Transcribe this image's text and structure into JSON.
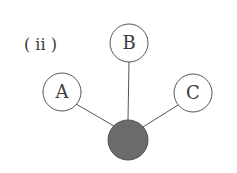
{
  "caption": "( ii )",
  "nodes": [
    {
      "id": "A",
      "label": "A",
      "cx": 62,
      "cy": 92,
      "r": 19,
      "filled": false
    },
    {
      "id": "B",
      "label": "B",
      "cx": 129,
      "cy": 43,
      "r": 19,
      "filled": false
    },
    {
      "id": "C",
      "label": "C",
      "cx": 193,
      "cy": 93,
      "r": 19,
      "filled": false
    },
    {
      "id": "center",
      "label": "",
      "cx": 128,
      "cy": 140,
      "r": 20,
      "filled": true
    }
  ],
  "edges": [
    {
      "from": "A",
      "to": "center"
    },
    {
      "from": "B",
      "to": "center"
    },
    {
      "from": "C",
      "to": "center"
    }
  ],
  "colors": {
    "stroke": "#555555",
    "fill_center": "#6b6b6b",
    "text": "#3a3a3a"
  }
}
